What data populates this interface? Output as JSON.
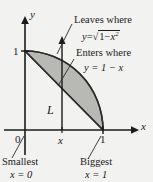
{
  "figure": {
    "background_color": "#f2f2f0",
    "ink_color": "#1a1a1a",
    "shade_color": "#b8b8b4",
    "axes": {
      "x_label": "x",
      "y_label": "y",
      "origin_label": "0",
      "x_tick_labels": [
        "x",
        "1"
      ],
      "y_tick_labels": [
        "1"
      ]
    },
    "slice": {
      "label": "L"
    },
    "annotations": {
      "leaves_title": "Leaves where",
      "leaves_eq_lhs": "y",
      "leaves_eq_rel": "=",
      "leaves_eq_radical": "√",
      "leaves_eq_radicand_a": "1",
      "leaves_eq_minus": "−",
      "leaves_eq_radicand_b": "x",
      "leaves_eq_exponent": "2",
      "enters_title": "Enters where",
      "enters_eq": "y = 1 − x",
      "smallest_title": "Smallest",
      "smallest_eq": "x = 0",
      "biggest_title": "Biggest",
      "biggest_eq": "x = 1"
    }
  }
}
